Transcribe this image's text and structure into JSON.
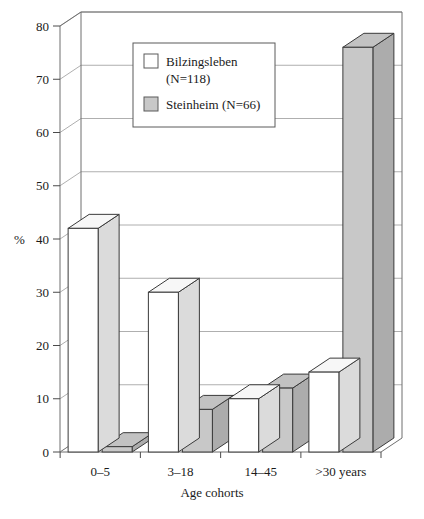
{
  "chart_data": {
    "type": "bar",
    "title": "",
    "subtitle": "",
    "xlabel": "Age cohorts",
    "ylabel": "%",
    "categories": [
      "0–5",
      "3–18",
      "14–45",
      ">30 years"
    ],
    "series": [
      {
        "name": "Bilzingsleben (N=118)",
        "values": [
          42,
          30,
          10,
          15
        ],
        "color": "#ffffff"
      },
      {
        "name": "Steinheim (N=66)",
        "values": [
          1,
          8,
          12,
          76
        ],
        "color": "#c8c8c8"
      }
    ],
    "legend": [
      {
        "label_line1": "Bilzingsleben",
        "label_line2": "(N=118)",
        "swatch": "#ffffff"
      },
      {
        "label_line1": "Steinheim (N=66)",
        "label_line2": "",
        "swatch": "#c8c8c8"
      }
    ],
    "legend_position": "top-center",
    "ylim": [
      0,
      80
    ],
    "ytick_values": [
      0,
      10,
      20,
      30,
      40,
      50,
      60,
      70,
      80
    ],
    "ytick_labels": [
      "0",
      "10",
      "20",
      "30",
      "40",
      "50",
      "60",
      "70",
      "80"
    ],
    "grid": true,
    "grid_axis": "y",
    "style": "3d-bars",
    "n_bilzingsleben": 118,
    "n_steinheim": 66
  }
}
